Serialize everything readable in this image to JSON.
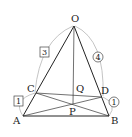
{
  "diagram": {
    "type": "geometry",
    "points": {
      "O": {
        "label": "O",
        "x": 74,
        "y": 26
      },
      "A": {
        "label": "A",
        "x": 23,
        "y": 116
      },
      "B": {
        "label": "B",
        "x": 109,
        "y": 116
      },
      "C": {
        "label": "C",
        "x": 36,
        "y": 93
      },
      "D": {
        "label": "D",
        "x": 102,
        "y": 97
      },
      "Q": {
        "label": "Q",
        "x": 74,
        "y": 95
      },
      "P": {
        "label": "P",
        "x": 73,
        "y": 104
      }
    },
    "ratios": {
      "oc": "3",
      "ca": "1",
      "od": "4",
      "db": "1"
    },
    "colors": {
      "line": "#222222",
      "arc": "#999999"
    }
  }
}
